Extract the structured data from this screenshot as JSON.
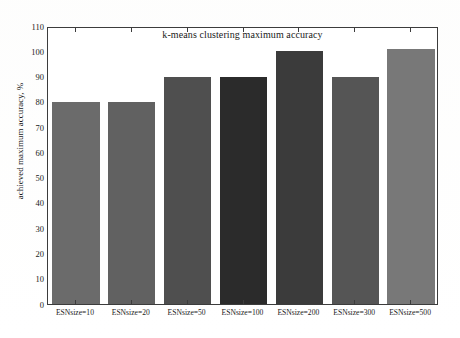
{
  "chart_data": {
    "type": "bar",
    "title": "k-means clustering maximum accuracy",
    "xlabel": "",
    "ylabel": "achieved maximum accuracy, %",
    "categories": [
      "ESNsize=10",
      "ESNsize=20",
      "ESNsize=50",
      "ESNsize=100",
      "ESNsize=200",
      "ESNsize=300",
      "ESNsize=500"
    ],
    "values": [
      80,
      80,
      90,
      90,
      100,
      90,
      101
    ],
    "bar_colors": [
      "#6b6b6b",
      "#616161",
      "#4f4f4f",
      "#2b2b2b",
      "#3b3b3b",
      "#555555",
      "#787878"
    ],
    "ylim": [
      0,
      110
    ],
    "ytick_labels": [
      "0",
      "10",
      "20",
      "30",
      "40",
      "50",
      "60",
      "70",
      "80",
      "90",
      "100",
      "110"
    ],
    "ytick_values": [
      0,
      10,
      20,
      30,
      40,
      50,
      60,
      70,
      80,
      90,
      100,
      110
    ],
    "grid": false,
    "legend": "none",
    "axis_color": "#3c3c3c",
    "background": "#ffffff"
  }
}
